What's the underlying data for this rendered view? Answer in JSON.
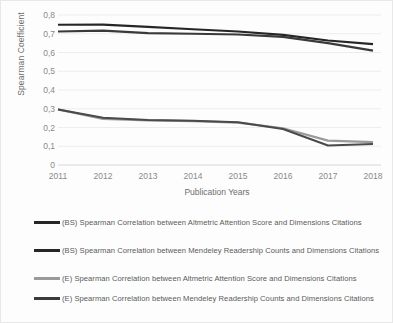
{
  "chart_data": {
    "type": "line",
    "title": "",
    "xlabel": "Publication Years",
    "ylabel": "Spearman Coefficient",
    "categories": [
      "2011",
      "2012",
      "2013",
      "2014",
      "2015",
      "2016",
      "2017",
      "2018"
    ],
    "ylim": [
      0,
      0.8
    ],
    "ytick_labels": [
      "0",
      "0,1",
      "0,2",
      "0,3",
      "0,4",
      "0,5",
      "0,6",
      "0,7",
      "0,8"
    ],
    "ytick_values": [
      0,
      0.1,
      0.2,
      0.3,
      0.4,
      0.5,
      0.6,
      0.7,
      0.8
    ],
    "grid": true,
    "legend_position": "bottom",
    "series": [
      {
        "name": "(BS) Spearman Correlation between Altmetric Attention Score and Dimensions Citations",
        "color": "#262626",
        "values": [
          0.748,
          0.749,
          0.737,
          0.724,
          0.712,
          0.694,
          0.664,
          0.645
        ]
      },
      {
        "name": "(BS) Spearman Correlation between Mendeley Readership Counts and Dimensions Citations",
        "color": "#3a3a3a",
        "values": [
          0.712,
          0.717,
          0.703,
          0.7,
          0.696,
          0.683,
          0.65,
          0.61
        ]
      },
      {
        "name": "(E) Spearman Correlation between Altmetric Attention Score and Dimensions Citations",
        "color": "#9a9a9a",
        "values": [
          0.297,
          0.246,
          0.238,
          0.234,
          0.226,
          0.196,
          0.13,
          0.122
        ]
      },
      {
        "name": "(E) Spearman Correlation between Mendeley Readership Counts and Dimensions Citations",
        "color": "#4a4a4a",
        "values": [
          0.296,
          0.252,
          0.24,
          0.236,
          0.228,
          0.192,
          0.104,
          0.112
        ]
      }
    ]
  },
  "legend": {
    "items": [
      {
        "label": "(BS) Spearman Correlation between Altmetric Attention Score and Dimensions Citations",
        "color": "#262626"
      },
      {
        "label": "(BS) Spearman Correlation between Mendeley Readership Counts and Dimensions Citations",
        "color": "#262626"
      },
      {
        "label": "(E) Spearman Correlation between Altmetric Attention Score and Dimensions Citations",
        "color": "#9a9a9a"
      },
      {
        "label": "(E) Spearman Correlation between Mendeley Readership Counts and Dimensions Citations",
        "color": "#3a3a3a"
      }
    ]
  }
}
